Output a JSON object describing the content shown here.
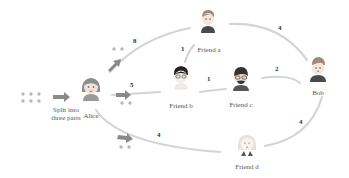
{
  "diagram": {
    "caption_split": "Split into three parts",
    "split_line1": "Split into",
    "split_line2": "three parts",
    "nodes": {
      "alice": "Alice",
      "bob": "Bob",
      "friend_a": "Friend a",
      "friend_b": "Friend b",
      "friend_c": "Friend c",
      "friend_d": "Friend d"
    },
    "edges": [
      {
        "from": "Alice",
        "to": "Friend a",
        "weight": "8"
      },
      {
        "from": "Alice",
        "to": "Friend b",
        "weight": "5"
      },
      {
        "from": "Alice",
        "to": "Friend d",
        "weight": "4"
      },
      {
        "from": "Friend b",
        "to": "Friend a",
        "weight": "1"
      },
      {
        "from": "Friend b",
        "to": "Friend c",
        "weight": "1"
      },
      {
        "from": "Friend a",
        "to": "Bob",
        "weight": "4"
      },
      {
        "from": "Friend c",
        "to": "Bob",
        "weight": "2"
      },
      {
        "from": "Friend d",
        "to": "Bob",
        "weight": "4"
      }
    ],
    "colors": {
      "curve": "#d0d0d0",
      "arrow": "#8a8a8a",
      "dots": "#b5b5b5",
      "text": "#555555"
    }
  }
}
